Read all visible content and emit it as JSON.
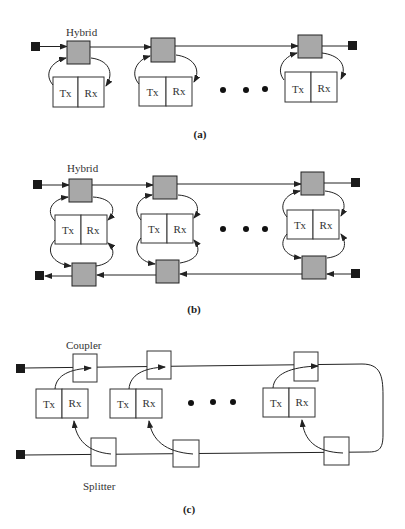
{
  "diagram": {
    "panels": [
      {
        "id": "a",
        "caption": "(a)",
        "hybrid_label": "Hybrid",
        "stations": [
          {
            "tx": "Tx",
            "rx": "Rx"
          },
          {
            "tx": "Tx",
            "rx": "Rx"
          },
          {
            "tx": "Tx",
            "rx": "Rx"
          }
        ],
        "ellipsis": "• • •"
      },
      {
        "id": "b",
        "caption": "(b)",
        "hybrid_label": "Hybrid",
        "stations": [
          {
            "tx": "Tx",
            "rx": "Rx"
          },
          {
            "tx": "Tx",
            "rx": "Rx"
          },
          {
            "tx": "Tx",
            "rx": "Rx"
          }
        ],
        "ellipsis": "• • •"
      },
      {
        "id": "c",
        "caption": "(c)",
        "coupler_label": "Coupler",
        "splitter_label": "Splitter",
        "stations": [
          {
            "tx": "Tx",
            "rx": "Rx"
          },
          {
            "tx": "Tx",
            "rx": "Rx"
          },
          {
            "tx": "Tx",
            "rx": "Rx"
          }
        ],
        "ellipsis": "• • •"
      }
    ]
  }
}
